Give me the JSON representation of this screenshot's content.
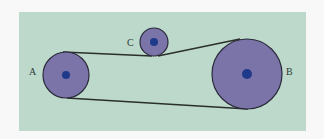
{
  "diagram": {
    "type": "belt-and-pulley",
    "background_color": "#bdd9cb",
    "pulley_fill": "#7a74a8",
    "pulley_stroke": "#2a2a3a",
    "hub_fill": "#1f3a8a",
    "belt_color": "#2a2e2c",
    "pulleys": [
      {
        "id": "A",
        "label": "A",
        "cx": 66,
        "cy": 75,
        "r": 23,
        "hub_r": 4,
        "label_x": 29,
        "label_y": 75
      },
      {
        "id": "C",
        "label": "C",
        "cx": 154,
        "cy": 42,
        "r": 14,
        "hub_r": 4,
        "label_x": 127,
        "label_y": 46
      },
      {
        "id": "B",
        "label": "B",
        "cx": 247,
        "cy": 74,
        "r": 35,
        "hub_r": 5,
        "label_x": 286,
        "label_y": 75
      }
    ],
    "belt_segments": [
      {
        "from": "A-top",
        "to": "C-bottom",
        "x1": 63,
        "y1": 52,
        "x2": 152,
        "y2": 56
      },
      {
        "from": "C-bottom",
        "to": "B-top",
        "x1": 158,
        "y1": 56,
        "x2": 240,
        "y2": 39
      },
      {
        "from": "A-bottom",
        "to": "B-bottom",
        "x1": 67,
        "y1": 98,
        "x2": 248,
        "y2": 109
      }
    ]
  }
}
